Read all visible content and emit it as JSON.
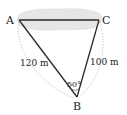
{
  "diagram": {
    "type": "triangle",
    "vertices": [
      {
        "id": "A",
        "label": "A"
      },
      {
        "id": "C",
        "label": "C"
      },
      {
        "id": "B",
        "label": "B"
      }
    ],
    "sides": [
      {
        "from": "A",
        "to": "B",
        "label": "120 m"
      },
      {
        "from": "C",
        "to": "B",
        "label": "100 m"
      },
      {
        "from": "A",
        "to": "C",
        "label": ""
      }
    ],
    "angle": {
      "vertex": "B",
      "label": "50°"
    },
    "colors": {
      "lines": "#2a2a2a",
      "lake": "#e6e6e6",
      "dotted": "#b0b0b0"
    }
  }
}
